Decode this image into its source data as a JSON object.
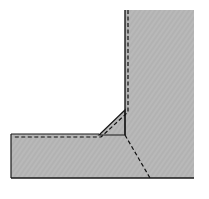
{
  "diagram": {
    "type": "fillet-weld-cross-section",
    "colors": {
      "background": "#ffffff",
      "plate_fill": "#b8b8b8",
      "outline": "#1a1a1a",
      "dashed": "#111111"
    },
    "vertical_plate": {
      "x": 125,
      "y": 10,
      "width": 69,
      "height": 168
    },
    "horizontal_plate": {
      "x": 11,
      "y": 134,
      "width": 114,
      "height": 44
    },
    "weld_triangle": {
      "points": "99,135 125,110 125,135"
    },
    "dashed_fusion_line": {
      "points": "128,10 128,112 101,137 13,137"
    },
    "dashed_diagonal": {
      "x1": 125,
      "y1": 135,
      "x2": 150,
      "y2": 178
    }
  }
}
